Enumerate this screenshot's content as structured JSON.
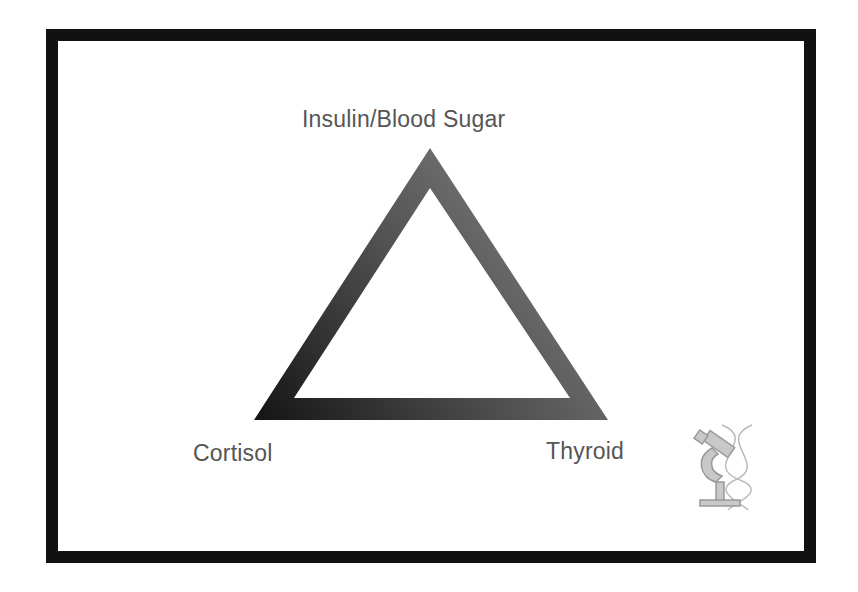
{
  "diagram": {
    "type": "triangle",
    "vertices": [
      {
        "label": "Insulin/Blood Sugar",
        "position": "top"
      },
      {
        "label": "Cortisol",
        "position": "bottom-left"
      },
      {
        "label": "Thyroid",
        "position": "bottom-right"
      }
    ],
    "icon": "microscope-dna-icon",
    "colors": {
      "frame": "#111111",
      "triangle_dark": "#1a1a1a",
      "triangle_light": "#8a8a8a",
      "label": "#555555"
    }
  }
}
